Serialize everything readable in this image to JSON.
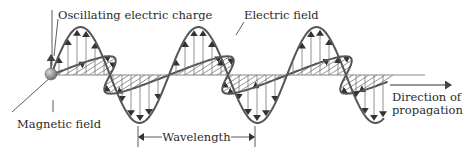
{
  "labels": {
    "charge": "Oscillating electric charge",
    "electric": "Electric field",
    "magnetic": "Magnetic field",
    "wavelength": "Wavelength",
    "direction_line1": "Direction of",
    "direction_line2": "propagation"
  },
  "colors": {
    "wave": "#555555",
    "vectors": "#777777",
    "charge_ball": "#8a8a8a"
  }
}
